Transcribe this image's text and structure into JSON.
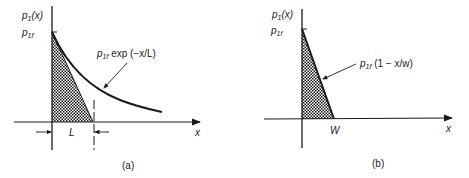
{
  "panel_a": {
    "y_label": "p",
    "y_label_sub": "1",
    "y_label_arg": "(x)",
    "p1f_label": "p",
    "p1f_sub": "1f",
    "curve_label_p": "p",
    "curve_label_sub": "1f",
    "curve_label_expr": " exp (−x/L)",
    "x_label": "x",
    "L_label": "L",
    "caption": "(a)"
  },
  "panel_b": {
    "y_label": "p",
    "y_label_sub": "1",
    "y_label_arg": "(x)",
    "p1f_label": "p",
    "p1f_sub": "1f",
    "line_label_p": "p",
    "line_label_sub": "1f",
    "line_label_expr": " (1 − x/w)",
    "x_label": "x",
    "W_label": "W",
    "caption": "(b)"
  },
  "colors": {
    "ink": "#1a1a1a",
    "background": "#ffffff"
  }
}
